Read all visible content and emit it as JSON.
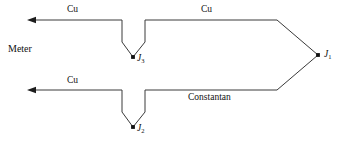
{
  "diagram": {
    "stroke_color": "#3a3a3a",
    "node_color": "#111111",
    "background": "#ffffff",
    "labels": {
      "meter": "Meter",
      "cu_top_left": "Cu",
      "cu_top_right": "Cu",
      "cu_bottom_left": "Cu",
      "constantan": "Constantan"
    },
    "nodes": [
      {
        "id": "j1",
        "name": "J",
        "sub": "1",
        "x": 318,
        "y": 55
      },
      {
        "id": "j3",
        "name": "J",
        "sub": "3",
        "x": 133,
        "y": 57
      },
      {
        "id": "j2",
        "name": "J",
        "sub": "2",
        "x": 133,
        "y": 127
      }
    ],
    "paths": {
      "top_wire": "M 30 20 L 122 20 L 122 42 L 133 57 L 145 42 L 145 20 L 277 20 L 318 55",
      "bottom_wire": "M 30 90 L 122 90 L 122 112 L 133 127 L 145 112 L 145 90 L 277 90 L 318 55"
    },
    "arrows": [
      {
        "id": "arrow-top",
        "tip_x": 27,
        "tip_y": 20,
        "direction": "left"
      },
      {
        "id": "arrow-bottom",
        "tip_x": 27,
        "tip_y": 90,
        "direction": "left"
      }
    ]
  }
}
